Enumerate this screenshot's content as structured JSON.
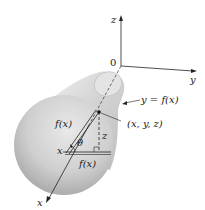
{
  "figure": {
    "axes": {
      "x_label": "x",
      "y_label": "y",
      "z_label": "z",
      "origin_label": "0"
    },
    "labels": {
      "curve": "y = f(x)",
      "point": "(x, y, z)",
      "radius_slant": "f(x)",
      "radius_horizontal": "f(x)",
      "height": "z",
      "angle": "θ",
      "x_position": "x"
    },
    "colors": {
      "solid_light": "#eeeeee",
      "solid_dark": "#9a9a9a",
      "line": "#222222"
    }
  }
}
